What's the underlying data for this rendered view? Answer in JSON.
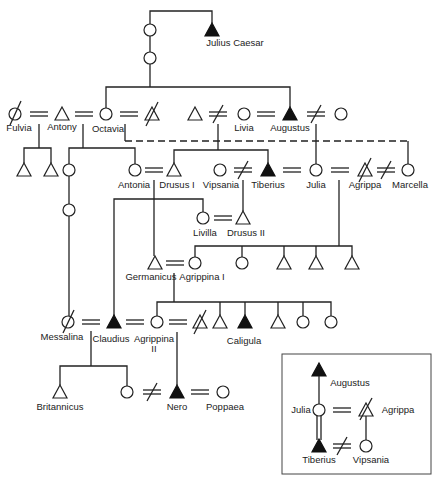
{
  "diagram": {
    "type": "genealogy",
    "people": [
      {
        "id": "julius_caesar",
        "name": "Julius Caesar",
        "sex": "male",
        "highlighted": true
      },
      {
        "id": "fulvia",
        "name": "Fulvia",
        "sex": "female",
        "deceased": true
      },
      {
        "id": "antony",
        "name": "Antony",
        "sex": "male"
      },
      {
        "id": "octavia",
        "name": "Octavia",
        "sex": "female"
      },
      {
        "id": "livia",
        "name": "Livia",
        "sex": "female"
      },
      {
        "id": "augustus",
        "name": "Augustus",
        "sex": "male",
        "highlighted": true
      },
      {
        "id": "antonia",
        "name": "Antonia",
        "sex": "female"
      },
      {
        "id": "drusus_i",
        "name": "Drusus I",
        "sex": "male"
      },
      {
        "id": "vipsania",
        "name": "Vipsania",
        "sex": "female"
      },
      {
        "id": "tiberius",
        "name": "Tiberius",
        "sex": "male",
        "highlighted": true
      },
      {
        "id": "julia",
        "name": "Julia",
        "sex": "female"
      },
      {
        "id": "agrippa",
        "name": "Agrippa",
        "sex": "male",
        "deceased": true
      },
      {
        "id": "marcella",
        "name": "Marcella",
        "sex": "female"
      },
      {
        "id": "livilla",
        "name": "Livilla",
        "sex": "female"
      },
      {
        "id": "drusus_ii",
        "name": "Drusus II",
        "sex": "male"
      },
      {
        "id": "germanicus",
        "name": "Germanicus",
        "sex": "male"
      },
      {
        "id": "agrippina_i",
        "name": "Agrippina I",
        "sex": "female"
      },
      {
        "id": "messalina",
        "name": "Messalina",
        "sex": "female",
        "deceased": true
      },
      {
        "id": "claudius",
        "name": "Claudius",
        "sex": "male",
        "highlighted": true
      },
      {
        "id": "agrippina_ii",
        "name": "Agrippina II",
        "sex": "female"
      },
      {
        "id": "caligula",
        "name": "Caligula",
        "sex": "male",
        "highlighted": true
      },
      {
        "id": "britannicus",
        "name": "Britannicus",
        "sex": "male"
      },
      {
        "id": "nero",
        "name": "Nero",
        "sex": "male",
        "highlighted": true
      },
      {
        "id": "poppaea",
        "name": "Poppaea",
        "sex": "female"
      }
    ],
    "labels": {
      "julius_caesar": "Julius Caesar",
      "fulvia": "Fulvia",
      "antony": "Antony",
      "octavia": "Octavia",
      "livia": "Livia",
      "augustus": "Augustus",
      "antonia": "Antonia",
      "drusus_i": "Drusus I",
      "vipsania": "Vipsania",
      "tiberius": "Tiberius",
      "julia": "Julia",
      "agrippa": "Agrippa",
      "marcella": "Marcella",
      "livilla": "Livilla",
      "drusus_ii": "Drusus II",
      "germanicus": "Germanicus",
      "agrippina_i": "Agrippina I",
      "messalina": "Messalina",
      "claudius": "Claudius",
      "agrippina_ii_1": "Agrippina",
      "agrippina_ii_2": "II",
      "caligula": "Caligula",
      "britannicus": "Britannicus",
      "nero": "Nero",
      "poppaea": "Poppaea"
    },
    "inset": {
      "labels": {
        "augustus": "Augustus",
        "julia": "Julia",
        "agrippa": "Agrippa",
        "tiberius": "Tiberius",
        "vipsania": "Vipsania"
      }
    },
    "legend_symbols": {
      "circle": "female",
      "triangle": "male",
      "filled_triangle": "emperor / dictator",
      "double_line": "marriage",
      "crossed_double_line": "divorce",
      "slash": "deceased/executed",
      "dashed_line": "betrothal/adoption link"
    }
  }
}
